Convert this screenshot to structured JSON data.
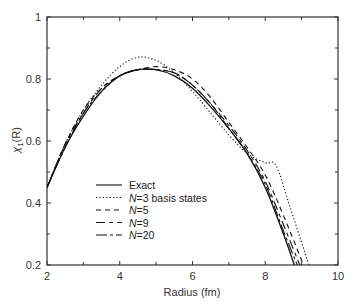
{
  "chart_data": {
    "type": "line",
    "title": "",
    "xlabel": "Radius (fm)",
    "ylabel": "χ1(R)",
    "xlim": [
      2,
      10
    ],
    "ylim": [
      0.2,
      1.0
    ],
    "x_ticks": [
      "2",
      "4",
      "6",
      "8",
      "10"
    ],
    "y_ticks": [
      "0.2",
      "0.4",
      "0.6",
      "0.8",
      "1"
    ],
    "grid": false,
    "legend_position": "lower-left inside",
    "series": [
      {
        "name": "Exact",
        "style": "solid",
        "x": [
          2.0,
          2.5,
          3.0,
          3.5,
          4.0,
          4.5,
          5.0,
          5.5,
          6.0,
          6.5,
          7.0,
          7.5,
          8.0,
          8.5,
          8.8
        ],
        "y": [
          0.45,
          0.58,
          0.68,
          0.76,
          0.81,
          0.83,
          0.83,
          0.81,
          0.77,
          0.71,
          0.64,
          0.56,
          0.45,
          0.3,
          0.2
        ]
      },
      {
        "name": "N=3 basis states",
        "style": "dotted",
        "x": [
          2.0,
          2.5,
          3.0,
          3.5,
          4.0,
          4.5,
          5.0,
          5.5,
          6.0,
          6.5,
          7.0,
          7.5,
          8.0,
          8.3,
          8.7,
          9.2
        ],
        "y": [
          0.45,
          0.59,
          0.7,
          0.78,
          0.84,
          0.87,
          0.86,
          0.82,
          0.76,
          0.69,
          0.62,
          0.56,
          0.53,
          0.52,
          0.38,
          0.2
        ]
      },
      {
        "name": "N=5",
        "style": "short-dash",
        "x": [
          2.0,
          2.5,
          3.0,
          3.5,
          4.0,
          4.5,
          5.0,
          5.5,
          6.0,
          6.5,
          7.0,
          7.5,
          8.0,
          8.5,
          9.05
        ],
        "y": [
          0.45,
          0.59,
          0.7,
          0.77,
          0.81,
          0.83,
          0.84,
          0.83,
          0.8,
          0.74,
          0.66,
          0.58,
          0.49,
          0.36,
          0.2
        ]
      },
      {
        "name": "N=9",
        "style": "long-dash",
        "x": [
          2.0,
          2.5,
          3.0,
          3.5,
          4.0,
          4.5,
          5.0,
          5.5,
          6.0,
          6.5,
          7.0,
          7.5,
          8.0,
          8.5,
          8.95
        ],
        "y": [
          0.45,
          0.59,
          0.69,
          0.77,
          0.81,
          0.83,
          0.83,
          0.82,
          0.78,
          0.72,
          0.65,
          0.57,
          0.47,
          0.33,
          0.2
        ]
      },
      {
        "name": "N=20",
        "style": "dash-dot",
        "x": [
          2.0,
          2.5,
          3.0,
          3.5,
          4.0,
          4.5,
          5.0,
          5.5,
          6.0,
          6.5,
          7.0,
          7.5,
          8.0,
          8.5,
          8.88
        ],
        "y": [
          0.45,
          0.58,
          0.69,
          0.76,
          0.81,
          0.83,
          0.83,
          0.82,
          0.78,
          0.72,
          0.64,
          0.56,
          0.46,
          0.31,
          0.2
        ]
      }
    ]
  },
  "legend": [
    {
      "prefix": "",
      "label": "Exact"
    },
    {
      "prefix": "N",
      "label": "=3 basis states"
    },
    {
      "prefix": "N",
      "label": "=5"
    },
    {
      "prefix": "N",
      "label": "=9"
    },
    {
      "prefix": "N",
      "label": "=20"
    }
  ],
  "axes": {
    "xlabel": "Radius (fm)",
    "ylabel_main": "χ",
    "ylabel_sub": "1",
    "ylabel_tail": "(R)"
  },
  "colors": {
    "line": "#111111",
    "axis": "#333333",
    "background": "#ffffff"
  }
}
